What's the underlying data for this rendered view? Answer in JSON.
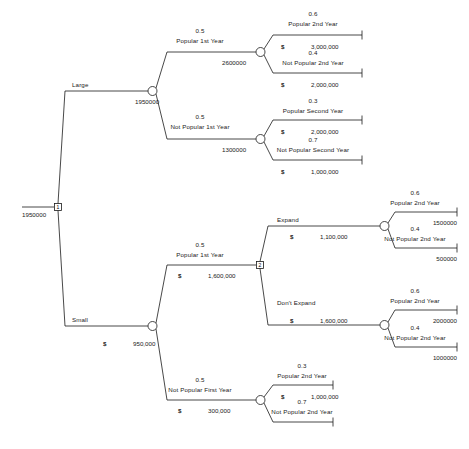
{
  "diagram": {
    "type": "decision-tree",
    "line_color": "#1a1a1a",
    "text_color": "#1a1a1a"
  },
  "nodes": {
    "root": {
      "kind": "decision",
      "id": "1",
      "value": "1950000"
    },
    "large_chance": {
      "kind": "chance",
      "value": "1950000"
    },
    "large_pop_chance": {
      "kind": "chance",
      "value": "2600000"
    },
    "large_notpop_chance": {
      "kind": "chance",
      "value": "1300000"
    },
    "small_chance": {
      "kind": "chance",
      "dollar": "$",
      "value": "950,000"
    },
    "small_pop_decision": {
      "kind": "decision",
      "id": "2"
    },
    "expand_chance": {
      "kind": "chance"
    },
    "dontexpand_chance": {
      "kind": "chance"
    },
    "small_notpop_chance": {
      "kind": "chance"
    }
  },
  "branches": {
    "large": {
      "label": "Large"
    },
    "small": {
      "label": "Small"
    },
    "large_popular_1st": {
      "prob": "0.5",
      "label": "Popular 1st Year"
    },
    "large_notpopular_1st": {
      "prob": "0.5",
      "label": "Not Popular 1st Year"
    },
    "large_pop_2nd": {
      "prob": "0.6",
      "label": "Popular 2nd Year"
    },
    "large_notpop_2nd": {
      "prob": "0.4",
      "label": "Not Popular 2nd Year"
    },
    "large_pop_second": {
      "prob": "0.3",
      "label": "Popular Second Year"
    },
    "large_notpop_second": {
      "prob": "0.7",
      "label": "Not Popular Second Year"
    },
    "small_popular_1st": {
      "prob": "0.5",
      "label": "Popular 1st Year"
    },
    "small_notpopular_1st": {
      "prob": "0.5",
      "label": "Not Popular First Year"
    },
    "expand": {
      "label": "Expand"
    },
    "dont_expand": {
      "label": "Don't Expand"
    },
    "expand_pop_2nd": {
      "prob": "0.6",
      "label": "Popular 2nd Year"
    },
    "expand_notpop_2nd": {
      "prob": "0.4",
      "label": "Not Popular 2nd Year"
    },
    "noexp_pop_2nd": {
      "prob": "0.6",
      "label": "Popular 2nd Year"
    },
    "noexp_notpop_2nd": {
      "prob": "0.4",
      "label": "Not Popular 2nd Year"
    },
    "small_np_pop_2nd": {
      "prob": "0.3",
      "label": "Popular 2nd Year"
    },
    "small_np_notpop_2nd": {
      "prob": "0.7",
      "label": "Not Popular 2nd Year"
    }
  },
  "payoffs": {
    "t1": {
      "dollar": "$",
      "amount": "3,000,000"
    },
    "t2": {
      "dollar": "$",
      "amount": "2,000,000"
    },
    "t3": {
      "dollar": "$",
      "amount": "2,000,000"
    },
    "t4": {
      "dollar": "$",
      "amount": "1,000,000"
    },
    "t5": {
      "amount": "1500000"
    },
    "t6": {
      "amount": "500000"
    },
    "t7": {
      "amount": "2000000"
    },
    "t8": {
      "amount": "1000000"
    },
    "t9": {
      "dollar": "$",
      "amount": "1,000,000"
    }
  },
  "branch_values": {
    "expand_value": {
      "dollar": "$",
      "amount": "1,100,000"
    },
    "dont_expand_value": {
      "dollar": "$",
      "amount": "1,600,000"
    },
    "small_pop_value": {
      "dollar": "$",
      "amount": "1,600,000"
    },
    "small_notpop_value": {
      "dollar": "$",
      "amount": "300,000"
    }
  }
}
